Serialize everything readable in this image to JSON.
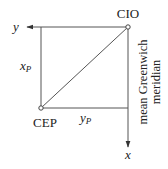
{
  "diagram": {
    "colors": {
      "line": "#555555",
      "text": "#222222",
      "background": "#ffffff"
    },
    "points": {
      "cio": {
        "label": "CIO"
      },
      "cep": {
        "label": "CEP"
      }
    },
    "axes": {
      "y": {
        "label": "y"
      },
      "x": {
        "label": "x"
      }
    },
    "components": {
      "xp": {
        "base": "x",
        "sub": "P"
      },
      "yp": {
        "base": "y",
        "sub": "P"
      }
    },
    "meridian_label": {
      "line1": "mean Greenwich",
      "line2": "meridian"
    }
  }
}
